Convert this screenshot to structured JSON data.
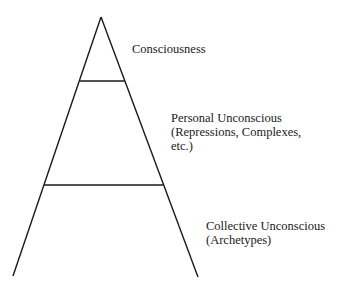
{
  "diagram": {
    "type": "pyramid",
    "levels": [
      {
        "name": "Consciousness",
        "lines": [
          "Consciousness"
        ]
      },
      {
        "name": "Personal Unconscious",
        "lines": [
          "Personal Unconscious",
          "(Repressions, Complexes,",
          "etc.)"
        ]
      },
      {
        "name": "Collective Unconscious",
        "lines": [
          "Collective Unconscious",
          "(Archetypes)"
        ]
      }
    ],
    "stroke_color": "#1a1a1a"
  }
}
